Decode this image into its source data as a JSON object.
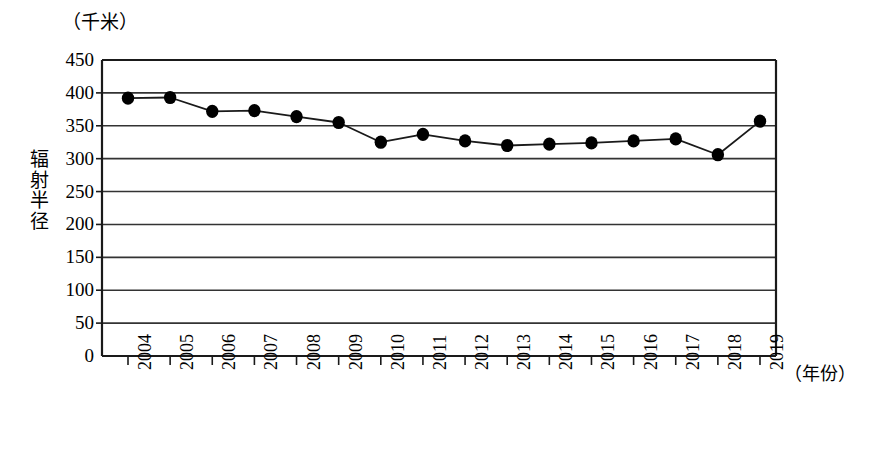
{
  "chart_data": {
    "type": "line",
    "title": "",
    "xlabel": "（年份）",
    "ylabel": "辐射半径",
    "yunit": "（千米）",
    "categories": [
      "2004",
      "2005",
      "2006",
      "2007",
      "2008",
      "2009",
      "2010",
      "2011",
      "2012",
      "2013",
      "2014",
      "2015",
      "2016",
      "2017",
      "2018",
      "2019"
    ],
    "values": [
      392,
      393,
      372,
      373,
      364,
      355,
      325,
      337,
      327,
      320,
      322,
      324,
      327,
      330,
      306,
      357
    ],
    "series": [
      {
        "name": "辐射半径",
        "values": [
          392,
          393,
          372,
          373,
          364,
          355,
          325,
          337,
          327,
          320,
          322,
          324,
          327,
          330,
          306,
          357
        ]
      }
    ],
    "ylim": [
      0,
      450
    ],
    "yticks": [
      0,
      50,
      100,
      150,
      200,
      250,
      300,
      350,
      400,
      450
    ],
    "ytick_labels": [
      "0",
      "50",
      "100",
      "150",
      "200",
      "250",
      "300",
      "350",
      "400",
      "450"
    ],
    "grid": "horizontal",
    "legend": "none",
    "marker": "filled-circle",
    "line_color": "#1a1a1a",
    "marker_color": "#000000",
    "grid_color": "#333333",
    "axis_color": "#1a1a1a",
    "background": "#ffffff"
  },
  "layout": {
    "plot_left": 102,
    "plot_right": 776,
    "plot_top": 60,
    "plot_bottom": 356
  }
}
